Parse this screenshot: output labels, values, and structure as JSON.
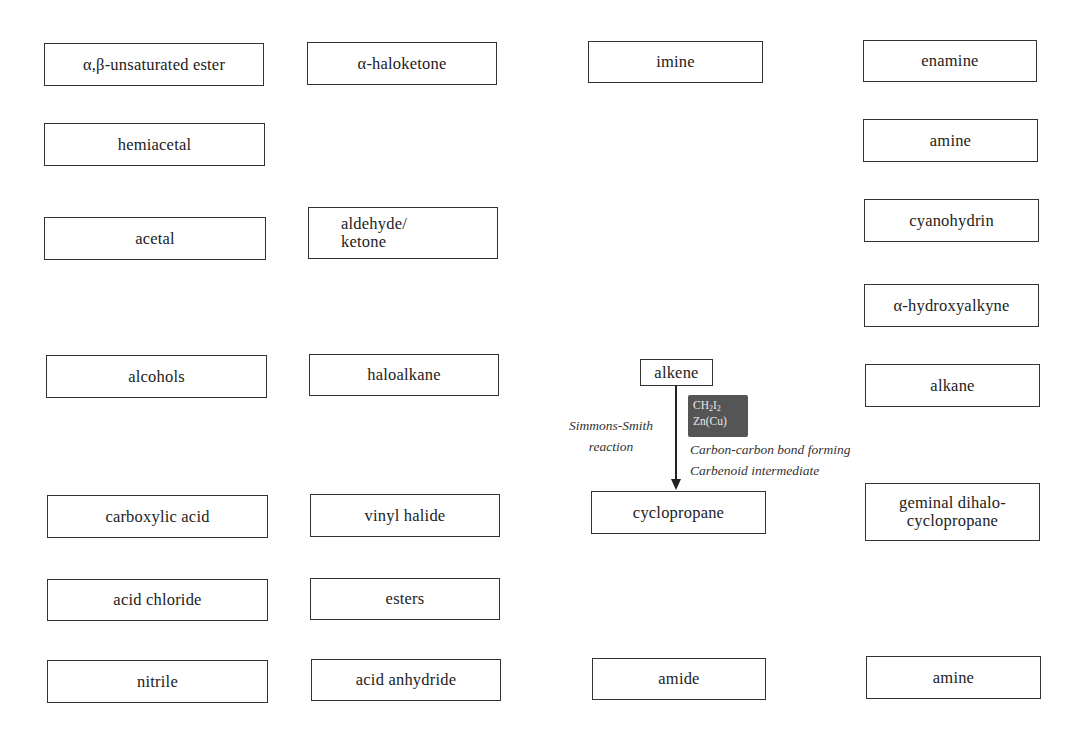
{
  "diagram": {
    "nodes": [
      {
        "id": "ab-unsaturated-ester",
        "label": "α,β-unsaturated ester",
        "x": 44,
        "y": 43,
        "w": 220,
        "h": 43
      },
      {
        "id": "a-haloketone",
        "label": "α-haloketone",
        "x": 307,
        "y": 42,
        "w": 190,
        "h": 43
      },
      {
        "id": "imine",
        "label": "imine",
        "x": 588,
        "y": 41,
        "w": 175,
        "h": 42
      },
      {
        "id": "enamine",
        "label": "enamine",
        "x": 863,
        "y": 40,
        "w": 174,
        "h": 42
      },
      {
        "id": "hemiacetal",
        "label": "hemiacetal",
        "x": 44,
        "y": 123,
        "w": 221,
        "h": 43
      },
      {
        "id": "amine-top",
        "label": "amine",
        "x": 863,
        "y": 119,
        "w": 175,
        "h": 43
      },
      {
        "id": "acetal",
        "label": "acetal",
        "x": 44,
        "y": 217,
        "w": 222,
        "h": 43
      },
      {
        "id": "aldehyde-ketone",
        "label": "aldehyde/\nketone",
        "x": 308,
        "y": 207,
        "w": 190,
        "h": 52,
        "align": "left"
      },
      {
        "id": "cyanohydrin",
        "label": "cyanohydrin",
        "x": 864,
        "y": 199,
        "w": 175,
        "h": 43
      },
      {
        "id": "a-hydroxyalkyne",
        "label": "α-hydroxyalkyne",
        "x": 864,
        "y": 284,
        "w": 175,
        "h": 43
      },
      {
        "id": "alcohols",
        "label": "alcohols",
        "x": 46,
        "y": 355,
        "w": 221,
        "h": 43
      },
      {
        "id": "haloalkane",
        "label": "haloalkane",
        "x": 309,
        "y": 354,
        "w": 190,
        "h": 42
      },
      {
        "id": "alkene",
        "label": "alkene",
        "x": 640,
        "y": 359,
        "w": 73,
        "h": 27
      },
      {
        "id": "alkane",
        "label": "alkane",
        "x": 865,
        "y": 364,
        "w": 175,
        "h": 43
      },
      {
        "id": "carboxylic-acid",
        "label": "carboxylic acid",
        "x": 47,
        "y": 495,
        "w": 221,
        "h": 43
      },
      {
        "id": "vinyl-halide",
        "label": "vinyl halide",
        "x": 310,
        "y": 494,
        "w": 190,
        "h": 43
      },
      {
        "id": "cyclopropane",
        "label": "cyclopropane",
        "x": 591,
        "y": 491,
        "w": 175,
        "h": 43
      },
      {
        "id": "geminal-dihalocyclopropane",
        "label": "geminal dihalo-\ncyclopropane",
        "x": 865,
        "y": 483,
        "w": 175,
        "h": 58
      },
      {
        "id": "acid-chloride",
        "label": "acid chloride",
        "x": 47,
        "y": 579,
        "w": 221,
        "h": 42
      },
      {
        "id": "esters",
        "label": "esters",
        "x": 310,
        "y": 578,
        "w": 190,
        "h": 42
      },
      {
        "id": "nitrile",
        "label": "nitrile",
        "x": 47,
        "y": 660,
        "w": 221,
        "h": 43
      },
      {
        "id": "acid-anhydride",
        "label": "acid anhydride",
        "x": 311,
        "y": 659,
        "w": 190,
        "h": 42
      },
      {
        "id": "amide",
        "label": "amide",
        "x": 592,
        "y": 658,
        "w": 174,
        "h": 42
      },
      {
        "id": "amine-bottom",
        "label": "amine",
        "x": 866,
        "y": 656,
        "w": 175,
        "h": 43
      }
    ],
    "reaction": {
      "from": "alkene",
      "to": "cyclopropane",
      "name_line1": "Simmons-Smith",
      "name_line2": "reaction",
      "reagent_line1_main": "CH",
      "reagent_line1_sub1": "2",
      "reagent_line1_mid": "I",
      "reagent_line1_sub2": "2",
      "reagent_line2": "Zn(Cu)",
      "note_line1": "Carbon-carbon bond forming",
      "note_line2": "Carbenoid intermediate"
    },
    "colors": {
      "box_border": "#333333",
      "reagent_bg": "#555555",
      "reagent_text": "#e8e8e8",
      "arrow": "#222222"
    }
  }
}
